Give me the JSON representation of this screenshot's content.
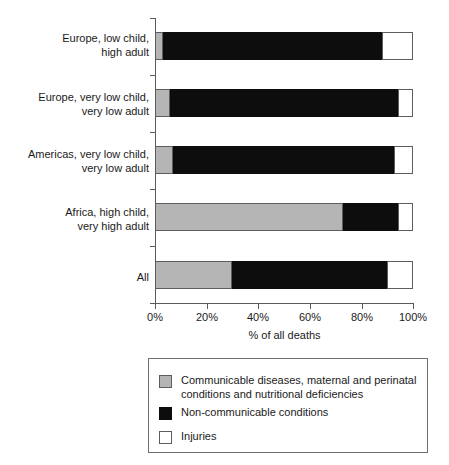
{
  "chart_data": {
    "type": "bar",
    "orientation": "horizontal",
    "stacked": true,
    "title": "",
    "subtitle": "",
    "xlabel": "% of all deaths",
    "ylabel": "",
    "xlim": [
      0,
      100
    ],
    "grid": false,
    "legend_position": "below-plot",
    "xticks": [
      0,
      20,
      40,
      60,
      80,
      100
    ],
    "xtick_labels": [
      "0%",
      "20%",
      "40%",
      "60%",
      "80%",
      "100%"
    ],
    "categories": [
      "Europe, low child,\nhigh adult",
      "Europe, very low child,\nvery low adult",
      "Americas, very low child,\nvery low adult",
      "Africa, high child,\nvery high adult",
      "All"
    ],
    "series": [
      {
        "name": "Communicable diseases, maternal and perinatal\nconditions and nutritional deficiencies",
        "color": "#b5b5b5",
        "values": [
          3,
          6,
          7,
          73,
          30
        ]
      },
      {
        "name": "Non-communicable conditions",
        "color": "#0d0d0d",
        "values": [
          85,
          88,
          85.5,
          21,
          60
        ]
      },
      {
        "name": "Injuries",
        "color": "#ffffff",
        "values": [
          12,
          6,
          7.5,
          6,
          10
        ]
      }
    ]
  },
  "axes": {
    "x_title": "% of all deaths",
    "tick_labels": [
      "0%",
      "20%",
      "40%",
      "60%",
      "80%",
      "100%"
    ]
  },
  "categories": {
    "c0": "Europe, low child,\nhigh adult",
    "c1": "Europe, very low child,\nvery low adult",
    "c2": "Americas, very low child,\nvery low adult",
    "c3": "Africa, high child,\nvery high adult",
    "c4": "All"
  },
  "legend": {
    "items": [
      {
        "label": "Communicable diseases, maternal and perinatal\nconditions and nutritional deficiencies",
        "color": "#b5b5b5"
      },
      {
        "label": "Non-communicable conditions",
        "color": "#0d0d0d"
      },
      {
        "label": "Injuries",
        "color": "#ffffff"
      }
    ]
  }
}
